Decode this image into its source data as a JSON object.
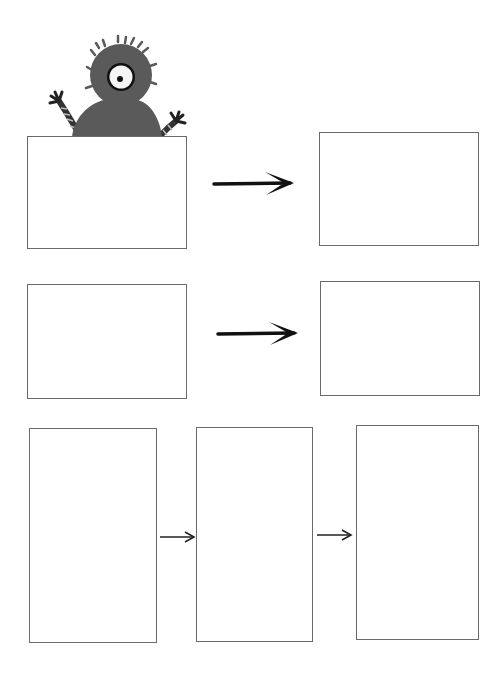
{
  "worksheet": {
    "description": "Sequencing worksheet with empty boxes connected by arrows",
    "mascot": {
      "icon": "one-eyed-fuzzy-monster-icon",
      "body_color": "#5a5a5a",
      "eye_color": "#ffffff"
    },
    "stroke_color": "#6a6a6a",
    "arrow_color": "#111111",
    "rows": [
      {
        "boxes": [
          {
            "label": ""
          },
          {
            "label": ""
          }
        ],
        "arrows": 1
      },
      {
        "boxes": [
          {
            "label": ""
          },
          {
            "label": ""
          }
        ],
        "arrows": 1
      },
      {
        "boxes": [
          {
            "label": ""
          },
          {
            "label": ""
          },
          {
            "label": ""
          }
        ],
        "arrows": 2
      }
    ]
  }
}
